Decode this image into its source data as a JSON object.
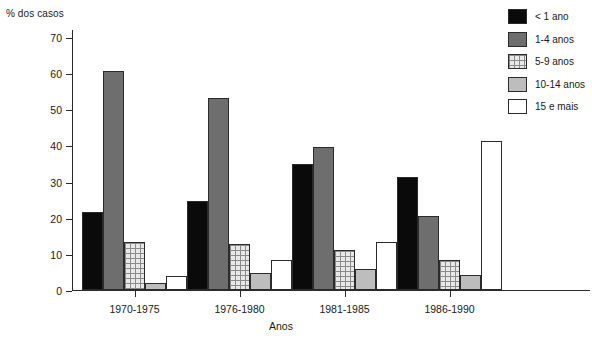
{
  "chart_data": {
    "type": "bar",
    "title": "",
    "ylabel": "% dos casos",
    "xlabel": "Anos",
    "categories": [
      "1970-1975",
      "1976-1980",
      "1981-1985",
      "1986-1990"
    ],
    "ylim": [
      0,
      70
    ],
    "yticks": [
      0,
      10,
      20,
      30,
      40,
      50,
      60,
      70
    ],
    "grid": false,
    "legend_position": "top-right",
    "series": [
      {
        "name": "< 1 ano",
        "color": "#0a0a0a",
        "pattern": "solid-black",
        "values": [
          21.6,
          24.5,
          35.0,
          31.3
        ]
      },
      {
        "name": "1-4 anos",
        "color": "#6e6e6e",
        "pattern": "solid-gray",
        "values": [
          60.5,
          53.0,
          39.5,
          20.5
        ]
      },
      {
        "name": "5-9 anos",
        "color": "#e8e8e8",
        "pattern": "crosshatch",
        "values": [
          13.3,
          12.7,
          11.2,
          8.3
        ]
      },
      {
        "name": "10-14 anos",
        "color": "#bdbdbd",
        "pattern": "light-gray",
        "values": [
          2.0,
          4.6,
          5.7,
          4.1
        ]
      },
      {
        "name": "15 e mais",
        "color": "#ffffff",
        "pattern": "white",
        "values": [
          3.9,
          8.2,
          13.2,
          41.2
        ]
      }
    ]
  },
  "axes": {
    "y_title": "% dos casos",
    "x_title": "Anos",
    "y_tick_labels": [
      "0",
      "10",
      "20",
      "30",
      "40",
      "50",
      "60",
      "70"
    ],
    "x_tick_labels": [
      "1970-1975",
      "1976-1980",
      "1981-1985",
      "1986-1990"
    ]
  },
  "legend": {
    "items": [
      {
        "label": "< 1 ano"
      },
      {
        "label": "1-4 anos"
      },
      {
        "label": "5-9 anos"
      },
      {
        "label": "10-14 anos"
      },
      {
        "label": "15 e mais"
      }
    ]
  }
}
